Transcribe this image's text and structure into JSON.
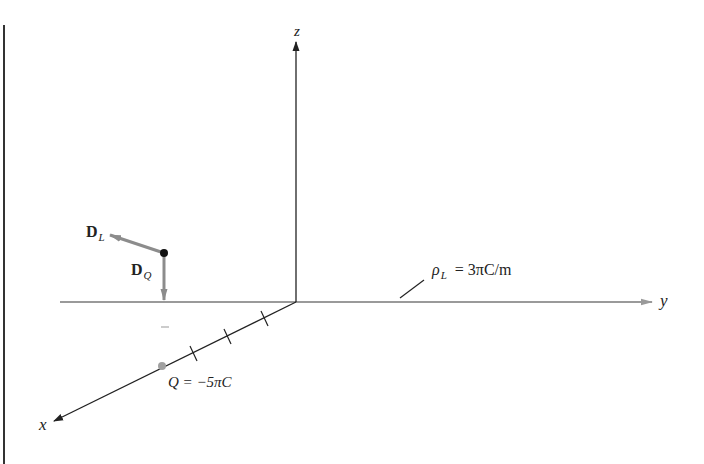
{
  "figure": {
    "axes": {
      "z_label": "z",
      "y_label": "y",
      "x_label": "x"
    },
    "line_charge": {
      "symbol": "ρ",
      "subscript": "L",
      "value_text": "= 3πC/m"
    },
    "point_charge": {
      "label": "Q = −5πC"
    },
    "vectors": {
      "d_l": {
        "symbol": "D",
        "subscript": "L"
      },
      "d_q": {
        "symbol": "D",
        "subscript": "Q"
      }
    },
    "minus_mark": "–",
    "colors": {
      "axis_black": "#222222",
      "axis_gray": "#9a9a9a",
      "vector_gray": "#8c8c8c",
      "charge_dot": "#a0a0a0",
      "point_black": "#111111"
    }
  }
}
